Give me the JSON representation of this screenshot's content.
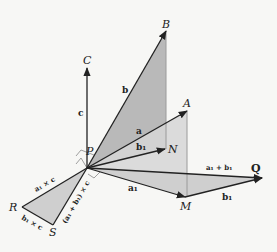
{
  "diagram": {
    "points": {
      "P": "P",
      "A": "A",
      "B": "B",
      "C": "C",
      "N": "N",
      "Q": "Q",
      "M": "M",
      "R": "R",
      "S": "S"
    },
    "vectors": {
      "a": "a",
      "b": "b",
      "c": "c",
      "b1": "b₁",
      "a1": "a₁",
      "b1_MQ": "b₁",
      "a1_plus_b1": "a₁ + b₁",
      "a1_cross_c": "a₁ × c",
      "b1_cross_c": "b₁ × c",
      "sum_cross_c": "(a₁ + b₁) × c"
    },
    "colors": {
      "background": "#f7f7f5",
      "line": "#222222",
      "shade_dark": "#b9b9b9",
      "shade_light": "#d6d6d6",
      "plane_edge": "#9a9a9a"
    }
  }
}
